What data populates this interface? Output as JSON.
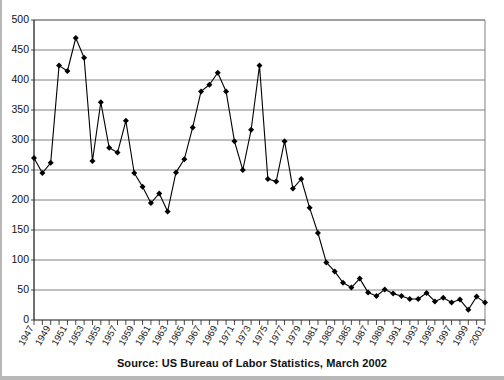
{
  "caption": {
    "text": "Source: US Bureau of Labor Statistics, March 2002"
  },
  "chart_data": {
    "type": "line",
    "title": "",
    "subtitle": "",
    "xlabel": "",
    "ylabel": "",
    "xlim": [
      1947,
      2001
    ],
    "ylim": [
      0,
      500
    ],
    "ytick_step": 50,
    "xtick_label_step": 2,
    "grid": true,
    "legend": null,
    "marker": "diamond",
    "line_color": "#000000",
    "marker_color": "#000000",
    "grid_color": "#808080",
    "yticks": [
      0,
      50,
      100,
      150,
      200,
      250,
      300,
      350,
      400,
      450,
      500
    ],
    "ytick_labels": [
      "0",
      "50",
      "100",
      "150",
      "200",
      "250",
      "300",
      "350",
      "400",
      "450",
      "500"
    ],
    "xtick_labels": [
      "1947",
      "1949",
      "1951",
      "1953",
      "1955",
      "1957",
      "1959",
      "1961",
      "1963",
      "1965",
      "1967",
      "1969",
      "1971",
      "1973",
      "1975",
      "1977",
      "1979",
      "1981",
      "1983",
      "1985",
      "1987",
      "1989",
      "1991",
      "1993",
      "1995",
      "1997",
      "1999",
      "2001"
    ],
    "x": [
      1947,
      1948,
      1949,
      1950,
      1951,
      1952,
      1953,
      1954,
      1955,
      1956,
      1957,
      1958,
      1959,
      1960,
      1961,
      1962,
      1963,
      1964,
      1965,
      1966,
      1967,
      1968,
      1969,
      1970,
      1971,
      1972,
      1973,
      1974,
      1975,
      1976,
      1977,
      1978,
      1979,
      1980,
      1981,
      1982,
      1983,
      1984,
      1985,
      1986,
      1987,
      1988,
      1989,
      1990,
      1991,
      1992,
      1993,
      1994,
      1995,
      1996,
      1997,
      1998,
      1999,
      2000,
      2001
    ],
    "values": [
      270,
      245,
      262,
      424,
      415,
      470,
      437,
      265,
      363,
      287,
      279,
      332,
      245,
      222,
      195,
      211,
      181,
      246,
      268,
      321,
      381,
      392,
      412,
      381,
      298,
      250,
      317,
      424,
      235,
      231,
      298,
      219,
      235,
      187,
      145,
      96,
      81,
      62,
      54,
      69,
      46,
      40,
      51,
      44,
      40,
      35,
      35,
      45,
      31,
      37,
      29,
      34,
      17,
      39,
      29
    ],
    "annotations": []
  }
}
